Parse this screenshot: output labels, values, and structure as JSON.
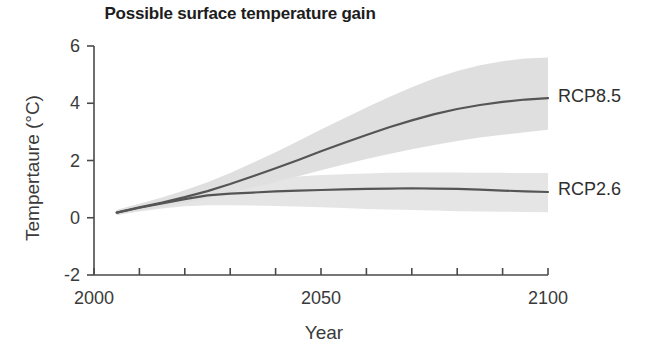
{
  "chart_data": {
    "type": "line",
    "title": "Possible surface temperature gain",
    "xlabel": "Year",
    "ylabel": "Tempertaure (°C)",
    "xlim": [
      2000,
      2100
    ],
    "ylim": [
      -2,
      6
    ],
    "xticks": [
      2000,
      2010,
      2020,
      2030,
      2040,
      2050,
      2060,
      2070,
      2080,
      2090,
      2100
    ],
    "xtick_labels": [
      "2000",
      "",
      "",
      "",
      "",
      "2050",
      "",
      "",
      "",
      "",
      "2100"
    ],
    "yticks": [
      -2,
      0,
      2,
      4,
      6
    ],
    "ytick_labels": [
      "-2",
      "0",
      "2",
      "4",
      "6"
    ],
    "grid": false,
    "legend_position": "right-inline",
    "band_label": "uncertainty range (shaded)",
    "x": [
      2005,
      2010,
      2015,
      2020,
      2025,
      2030,
      2035,
      2040,
      2045,
      2050,
      2055,
      2060,
      2065,
      2070,
      2075,
      2080,
      2085,
      2090,
      2095,
      2100
    ],
    "series": [
      {
        "name": "RCP8.5",
        "color": "#555555",
        "band_color": "#d9d9d9",
        "values": [
          0.18,
          0.36,
          0.53,
          0.72,
          0.93,
          1.18,
          1.45,
          1.73,
          2.02,
          2.32,
          2.61,
          2.89,
          3.16,
          3.4,
          3.62,
          3.8,
          3.94,
          4.05,
          4.13,
          4.18
        ],
        "band_low": [
          0.1,
          0.24,
          0.37,
          0.51,
          0.67,
          0.86,
          1.05,
          1.25,
          1.45,
          1.66,
          1.86,
          2.05,
          2.23,
          2.39,
          2.54,
          2.68,
          2.8,
          2.9,
          2.99,
          3.07
        ],
        "band_high": [
          0.27,
          0.49,
          0.71,
          0.96,
          1.24,
          1.56,
          1.92,
          2.29,
          2.68,
          3.08,
          3.47,
          3.85,
          4.22,
          4.56,
          4.87,
          5.13,
          5.33,
          5.47,
          5.56,
          5.6
        ]
      },
      {
        "name": "RCP2.6",
        "color": "#555555",
        "band_color": "#e0e0e0",
        "values": [
          0.18,
          0.35,
          0.5,
          0.65,
          0.78,
          0.84,
          0.88,
          0.92,
          0.95,
          0.97,
          0.99,
          1.01,
          1.02,
          1.03,
          1.02,
          1.01,
          0.98,
          0.95,
          0.92,
          0.9
        ],
        "band_low": [
          0.1,
          0.22,
          0.32,
          0.4,
          0.44,
          0.44,
          0.43,
          0.41,
          0.39,
          0.37,
          0.34,
          0.31,
          0.29,
          0.27,
          0.25,
          0.23,
          0.22,
          0.21,
          0.2,
          0.19
        ],
        "band_high": [
          0.27,
          0.48,
          0.69,
          0.9,
          1.1,
          1.22,
          1.31,
          1.38,
          1.44,
          1.49,
          1.52,
          1.55,
          1.57,
          1.58,
          1.58,
          1.58,
          1.57,
          1.57,
          1.56,
          1.56
        ]
      }
    ]
  },
  "axes_geometry": {
    "left": 94,
    "right": 548,
    "top": 46,
    "bottom": 275
  },
  "style": {
    "axis_color": "#4a4a4a",
    "line_color": "#555555",
    "band_color_high": "#d9d9d9",
    "band_color_low": "#e2e2e2",
    "text_color": "#3a3a3a",
    "background": "#ffffff"
  }
}
